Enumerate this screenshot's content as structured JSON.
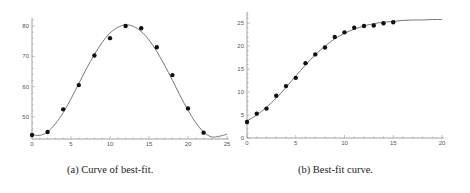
{
  "chart_data": [
    {
      "type": "scatter",
      "caption": "(a) Curve of best-fit.",
      "title": "",
      "xlabel": "",
      "ylabel": "",
      "xlim": [
        0,
        25
      ],
      "ylim": [
        42.7,
        82
      ],
      "xticks": [
        0,
        5,
        10,
        15,
        20,
        25
      ],
      "yticks": [
        50,
        60,
        70,
        80
      ],
      "grid": false,
      "series": [
        {
          "name": "data",
          "style": "points",
          "x": [
            0,
            2,
            4,
            6,
            8,
            10,
            12,
            14,
            16,
            18,
            20,
            22
          ],
          "y": [
            44,
            45,
            52.5,
            60.5,
            70.3,
            76,
            80,
            79.3,
            73,
            63.8,
            52.8,
            44.8
          ]
        },
        {
          "name": "best-fit curve",
          "style": "line",
          "model": "sinusoidal",
          "x": [
            0,
            1,
            2,
            3,
            4,
            5,
            6,
            7,
            8,
            9,
            10,
            11,
            12,
            13,
            14,
            15,
            16,
            17,
            18,
            19,
            20,
            21,
            22,
            23,
            24,
            25
          ],
          "y": [
            44.2,
            43.9,
            45.1,
            47.7,
            51.4,
            56.0,
            61.0,
            66.0,
            70.6,
            74.6,
            77.7,
            79.6,
            80.4,
            79.9,
            78.2,
            75.4,
            71.6,
            67.1,
            62.1,
            57.0,
            52.2,
            48.1,
            45.0,
            43.4,
            43.6,
            44.3
          ]
        }
      ]
    },
    {
      "type": "scatter",
      "caption": "(b) Best-fit curve.",
      "title": "",
      "xlabel": "",
      "ylabel": "",
      "xlim": [
        0,
        20
      ],
      "ylim": [
        0,
        27
      ],
      "xticks": [
        0,
        5,
        10,
        15,
        20
      ],
      "yticks": [
        0,
        5,
        10,
        15,
        20,
        25
      ],
      "grid": false,
      "series": [
        {
          "name": "data",
          "style": "points",
          "x": [
            0,
            1,
            2,
            3,
            4,
            5,
            6,
            7,
            8,
            9,
            10,
            11,
            12,
            13,
            14,
            15
          ],
          "y": [
            3.5,
            5.3,
            6.4,
            9.2,
            11.3,
            13.1,
            16.3,
            18.2,
            19.7,
            22,
            23,
            24,
            24.4,
            24.5,
            25,
            25.2
          ]
        },
        {
          "name": "best-fit curve",
          "style": "line",
          "model": "logistic",
          "x": [
            0,
            1,
            2,
            3,
            4,
            5,
            6,
            7,
            8,
            9,
            10,
            11,
            12,
            13,
            14,
            15,
            16,
            17,
            18,
            19,
            20
          ],
          "y": [
            3.7,
            5.0,
            6.7,
            8.7,
            11.0,
            13.5,
            15.9,
            18.1,
            20.0,
            21.6,
            22.8,
            23.7,
            24.4,
            24.9,
            25.2,
            25.4,
            25.6,
            25.7,
            25.7,
            25.8,
            25.8
          ]
        }
      ]
    }
  ]
}
